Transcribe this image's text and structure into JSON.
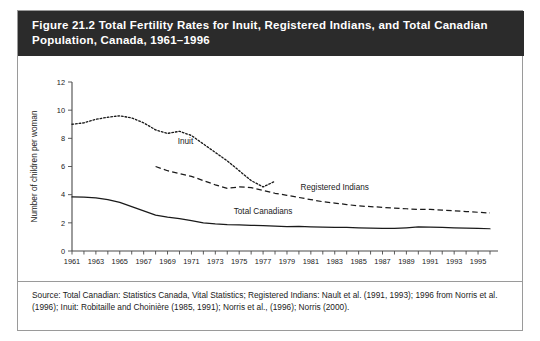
{
  "figure": {
    "title": "Figure 21.2 Total Fertility Rates for Inuit, Registered Indians, and Total Canadian Population, Canada, 1961–1996",
    "source": "Source: Total Canadian: Statistics Canada, Vital Statistics; Registered Indians: Nault et al. (1991, 1993); 1996 from Norris et al. (1996); Inuit: Robitaille and Choinière (1985, 1991); Norris et al., (1996); Norris (2000)."
  },
  "chart_data": {
    "type": "line",
    "title": "Figure 21.2 Total Fertility Rates for Inuit, Registered Indians, and Total Canadian Population, Canada, 1961–1996",
    "xlabel": "",
    "ylabel": "Number of children per woman",
    "xlim": [
      1961,
      1996
    ],
    "ylim": [
      0,
      12
    ],
    "yticks": [
      0,
      2,
      4,
      6,
      8,
      10,
      12
    ],
    "xticks": [
      1961,
      1963,
      1965,
      1967,
      1969,
      1971,
      1973,
      1975,
      1977,
      1979,
      1981,
      1983,
      1985,
      1987,
      1989,
      1991,
      1993,
      1995
    ],
    "xtick_labels": [
      "1961",
      "1963",
      "1965",
      "1967",
      "1969",
      "1971",
      "1973",
      "1975",
      "1977",
      "1979",
      "1981",
      "1983",
      "1985",
      "1987",
      "1989",
      "1991",
      "1993",
      "1995"
    ],
    "xtick_minor_every": 1,
    "grid": false,
    "legend": "inline-labels",
    "series": [
      {
        "name": "Inuit",
        "style": "dotted",
        "color": "#1a1a1a",
        "x": [
          1961,
          1962,
          1963,
          1964,
          1965,
          1966,
          1967,
          1968,
          1969,
          1970,
          1971,
          1972,
          1973,
          1974,
          1975,
          1976,
          1977,
          1978
        ],
        "values": [
          9.0,
          9.1,
          9.35,
          9.5,
          9.6,
          9.45,
          9.1,
          8.6,
          8.35,
          8.5,
          8.2,
          7.6,
          7.0,
          6.4,
          5.7,
          5.0,
          4.55,
          4.95
        ]
      },
      {
        "name": "Registered Indians",
        "style": "dashed",
        "color": "#1a1a1a",
        "x": [
          1968,
          1969,
          1970,
          1971,
          1972,
          1973,
          1974,
          1975,
          1976,
          1977,
          1978,
          1979,
          1980,
          1981,
          1982,
          1983,
          1984,
          1985,
          1986,
          1987,
          1988,
          1989,
          1990,
          1991,
          1992,
          1993,
          1994,
          1995,
          1996
        ],
        "values": [
          6.0,
          5.7,
          5.5,
          5.3,
          5.0,
          4.7,
          4.45,
          4.55,
          4.5,
          4.3,
          4.1,
          3.95,
          3.8,
          3.65,
          3.5,
          3.4,
          3.3,
          3.2,
          3.15,
          3.1,
          3.05,
          3.0,
          2.95,
          2.95,
          2.9,
          2.85,
          2.8,
          2.75,
          2.7
        ]
      },
      {
        "name": "Total Canadians",
        "style": "solid",
        "color": "#1a1a1a",
        "x": [
          1961,
          1962,
          1963,
          1964,
          1965,
          1966,
          1967,
          1968,
          1969,
          1970,
          1971,
          1972,
          1973,
          1974,
          1975,
          1976,
          1977,
          1978,
          1979,
          1980,
          1981,
          1982,
          1983,
          1984,
          1985,
          1986,
          1987,
          1988,
          1989,
          1990,
          1991,
          1992,
          1993,
          1994,
          1995,
          1996
        ],
        "values": [
          3.84,
          3.82,
          3.78,
          3.65,
          3.45,
          3.15,
          2.85,
          2.55,
          2.4,
          2.3,
          2.15,
          2.0,
          1.93,
          1.88,
          1.85,
          1.82,
          1.8,
          1.76,
          1.73,
          1.75,
          1.72,
          1.7,
          1.68,
          1.67,
          1.65,
          1.62,
          1.6,
          1.6,
          1.65,
          1.71,
          1.7,
          1.68,
          1.65,
          1.62,
          1.6,
          1.58
        ]
      }
    ],
    "annotations": [
      {
        "text": "Inuit",
        "x": 1970.5,
        "y": 7.6
      },
      {
        "text": "Registered Indians",
        "x": 1983.0,
        "y": 4.35
      },
      {
        "text": "Total Canadians",
        "x": 1977.0,
        "y": 2.6
      }
    ]
  }
}
